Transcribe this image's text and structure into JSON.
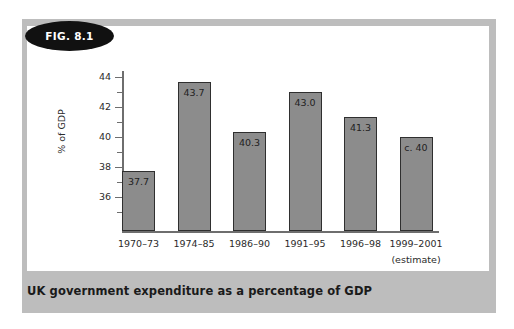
{
  "figure": {
    "badge_label": "FIG. 8.1",
    "caption": "UK government expenditure as a percentage of GDP"
  },
  "colors": {
    "panel_grey": "#bdbdbd",
    "card_white": "#ffffff",
    "bar_fill": "#8c8c8c",
    "bar_border": "#2f2f2f",
    "badge_fill": "#111111",
    "axis": "#6e6e6e",
    "text": "#2b2b2b"
  },
  "chart_data": {
    "type": "bar",
    "title": "UK government expenditure as a percentage of GDP",
    "xlabel": "",
    "ylabel": "% of GDP",
    "categories": [
      "1970–73",
      "1974–85",
      "1986–90",
      "1991–95",
      "1996–98",
      "1999–2001"
    ],
    "category_sublabels": [
      "",
      "",
      "",
      "",
      "",
      "(estimate)"
    ],
    "values": [
      37.7,
      43.7,
      40.3,
      43.0,
      41.3,
      40.0
    ],
    "value_labels": [
      "37.7",
      "43.7",
      "40.3",
      "43.0",
      "41.3",
      "c. 40"
    ],
    "ylim": [
      33.7,
      44.8
    ],
    "y_major_ticks": [
      36,
      38,
      40,
      42,
      44
    ],
    "y_major_tick_labels": [
      "36",
      "38",
      "40",
      "42",
      "44"
    ],
    "y_minor_ticks": [
      35,
      37,
      39,
      41,
      43,
      44
    ],
    "grid": false,
    "legend": false
  }
}
